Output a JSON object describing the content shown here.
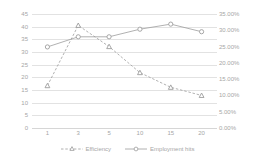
{
  "chart_data": {
    "type": "line",
    "title": "",
    "xlabel": "",
    "ylabel": "",
    "categories": [
      "1",
      "3",
      "5",
      "10",
      "15",
      "20"
    ],
    "grid": true,
    "legend_position": "bottom",
    "axes": {
      "left": {
        "ticks": [
          "0",
          "5",
          "10",
          "15",
          "20",
          "25",
          "30",
          "35",
          "40",
          "45"
        ],
        "values": [
          0,
          5,
          10,
          15,
          20,
          25,
          30,
          35,
          40,
          45
        ],
        "min": 0,
        "max": 45
      },
      "right": {
        "ticks": [
          "0.00%",
          "5.00%",
          "10.00%",
          "15.00%",
          "20.00%",
          "25.00%",
          "30.00%",
          "35.00%"
        ],
        "values": [
          0,
          5,
          10,
          15,
          20,
          25,
          30,
          35
        ],
        "min": 0,
        "max": 35
      },
      "x": {
        "ticks": [
          "1",
          "3",
          "5",
          "10",
          "15",
          "20"
        ]
      }
    },
    "series": [
      {
        "name": "Efficiency",
        "axis": "right",
        "marker": "triangle",
        "line_style": "dashed",
        "color": "#9d9d9d",
        "values": [
          13.0,
          31.5,
          25.0,
          17.0,
          12.5,
          10.0
        ],
        "display_values": [
          "13.00%",
          "31.50%",
          "25.00%",
          "17.00%",
          "12.50%",
          "10.00%"
        ]
      },
      {
        "name": "Employment hits",
        "axis": "left",
        "marker": "circle",
        "line_style": "solid",
        "color": "#9d9d9d",
        "values": [
          32,
          36,
          36,
          39,
          41,
          38
        ],
        "display_values": [
          "32",
          "36",
          "36",
          "39",
          "41",
          "38"
        ]
      }
    ]
  },
  "legend": {
    "items": [
      {
        "label": "Efficiency"
      },
      {
        "label": "Employment hits"
      }
    ]
  }
}
